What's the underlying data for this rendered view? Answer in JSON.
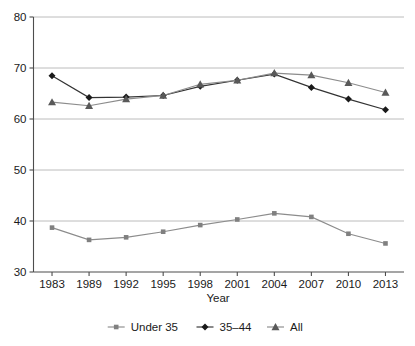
{
  "chart_data": {
    "type": "line",
    "title": "",
    "xlabel": "Year",
    "ylabel": "",
    "categories": [
      "1983",
      "1989",
      "1992",
      "1995",
      "1998",
      "2001",
      "2004",
      "2007",
      "2010",
      "2013"
    ],
    "ylim": [
      30,
      80
    ],
    "yticks": [
      30,
      40,
      50,
      60,
      70,
      80
    ],
    "grid": "horizontal",
    "legend_position": "bottom",
    "series": [
      {
        "name": "Under 35",
        "marker": "square",
        "color": "#808080",
        "line_color": "#8c8c8c",
        "values": [
          38.7,
          36.3,
          36.8,
          37.9,
          39.2,
          40.3,
          41.5,
          40.8,
          37.5,
          35.6
        ]
      },
      {
        "name": "35–44",
        "marker": "diamond",
        "color": "#1a1a1a",
        "line_color": "#333333",
        "values": [
          68.5,
          64.2,
          64.3,
          64.6,
          66.4,
          67.6,
          68.8,
          66.2,
          63.9,
          61.8
        ]
      },
      {
        "name": "All",
        "marker": "triangle",
        "color": "#595959",
        "line_color": "#8c8c8c",
        "values": [
          63.3,
          62.6,
          63.9,
          64.6,
          66.8,
          67.6,
          69.0,
          68.6,
          67.1,
          65.2
        ]
      }
    ]
  },
  "axes": {
    "ytick_labels": [
      "80",
      "70",
      "60",
      "50",
      "40",
      "30"
    ],
    "xtick_labels": [
      "1983",
      "1989",
      "1992",
      "1995",
      "1998",
      "2001",
      "2004",
      "2007",
      "2010",
      "2013"
    ],
    "xaxis_title": "Year"
  },
  "legend": {
    "items": [
      {
        "label": "Under 35",
        "marker": "square-marker"
      },
      {
        "label": "35–44",
        "marker": "diamond-marker"
      },
      {
        "label": "All",
        "marker": "triangle-marker"
      }
    ]
  },
  "colors": {
    "under35": "#808080",
    "age35to44": "#1a1a1a",
    "all": "#595959",
    "grid": "#b4b4b4",
    "axis": "#4d4d4d",
    "background": "#ffffff"
  }
}
